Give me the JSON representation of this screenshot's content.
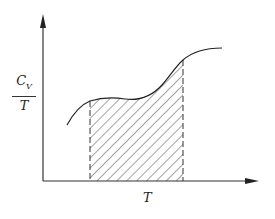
{
  "diagram": {
    "y_axis_label": {
      "numerator": "C",
      "subscript": "V",
      "denominator": "T"
    },
    "x_axis_label": "T",
    "curve": {
      "description": "C_V/T versus T, rising S-shaped curve"
    },
    "shaded_region": {
      "pattern": "diagonal hatch",
      "bounded_by": "dashed vertical lines"
    },
    "colors": {
      "line": "#222222",
      "background": "#ffffff"
    }
  }
}
